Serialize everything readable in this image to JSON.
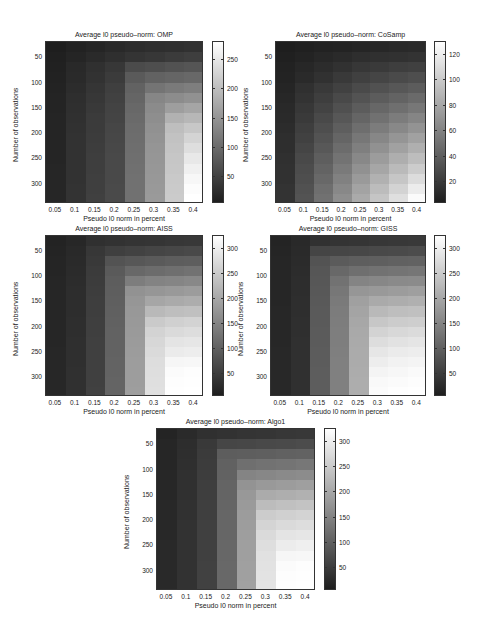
{
  "chart_data": [
    {
      "type": "heatmap",
      "title": "Average l0 pseudo–norm: OMP",
      "xlabel": "Pseudo l0 norm in percent",
      "ylabel": "Number of observations",
      "x": [
        "0.05",
        "0.1",
        "0.15",
        "0.2",
        "0.25",
        "0.3",
        "0.35",
        "0.4"
      ],
      "y": [
        30,
        50,
        70,
        90,
        110,
        130,
        150,
        170,
        190,
        210,
        230,
        250,
        270,
        290,
        310,
        330
      ],
      "yticks": [
        50,
        100,
        150,
        200,
        250,
        300
      ],
      "colorbar": {
        "min": 5,
        "max": 280,
        "ticks": [
          50,
          100,
          150,
          200,
          250
        ]
      },
      "values": [
        [
          5,
          10,
          14,
          18,
          22,
          24,
          26,
          28
        ],
        [
          7,
          14,
          20,
          26,
          32,
          36,
          40,
          44
        ],
        [
          9,
          18,
          27,
          36,
          60,
          64,
          68,
          72
        ],
        [
          10,
          20,
          30,
          40,
          78,
          88,
          92,
          96
        ],
        [
          11,
          22,
          33,
          45,
          88,
          110,
          118,
          122
        ],
        [
          12,
          24,
          36,
          48,
          92,
          132,
          140,
          146
        ],
        [
          12,
          26,
          38,
          50,
          96,
          138,
          162,
          170
        ],
        [
          13,
          27,
          40,
          52,
          98,
          142,
          185,
          192
        ],
        [
          13,
          28,
          41,
          54,
          100,
          145,
          200,
          212
        ],
        [
          14,
          29,
          42,
          55,
          102,
          148,
          205,
          228
        ],
        [
          14,
          29,
          43,
          56,
          103,
          150,
          208,
          240
        ],
        [
          14,
          30,
          44,
          57,
          104,
          152,
          210,
          252
        ],
        [
          15,
          30,
          44,
          58,
          105,
          153,
          212,
          262
        ],
        [
          15,
          30,
          45,
          58,
          106,
          154,
          214,
          270
        ],
        [
          15,
          31,
          45,
          59,
          106,
          155,
          215,
          276
        ],
        [
          15,
          31,
          46,
          59,
          107,
          156,
          216,
          280
        ]
      ]
    },
    {
      "type": "heatmap",
      "title": "Average l0 pseudo–norm: CoSamp",
      "xlabel": "Pseudo l0 norm in percent",
      "ylabel": "Number of observations",
      "x": [
        "0.05",
        "0.1",
        "0.15",
        "0.2",
        "0.25",
        "0.3",
        "0.35",
        "0.4"
      ],
      "y": [
        30,
        50,
        70,
        90,
        110,
        130,
        150,
        170,
        190,
        210,
        230,
        250,
        270,
        290,
        310,
        330
      ],
      "yticks": [
        50,
        100,
        150,
        200,
        250,
        300
      ],
      "colorbar": {
        "min": 3,
        "max": 130,
        "ticks": [
          20,
          40,
          60,
          80,
          100,
          120
        ]
      },
      "values": [
        [
          3,
          4,
          5,
          6,
          7,
          8,
          9,
          10
        ],
        [
          4,
          6,
          8,
          10,
          12,
          13,
          14,
          15
        ],
        [
          5,
          8,
          11,
          14,
          17,
          19,
          21,
          22
        ],
        [
          6,
          10,
          14,
          18,
          22,
          25,
          28,
          30
        ],
        [
          7,
          13,
          18,
          23,
          28,
          32,
          35,
          38
        ],
        [
          8,
          15,
          21,
          27,
          33,
          38,
          42,
          46
        ],
        [
          9,
          17,
          24,
          31,
          38,
          44,
          49,
          53
        ],
        [
          10,
          19,
          27,
          35,
          43,
          50,
          56,
          61
        ],
        [
          11,
          21,
          30,
          39,
          48,
          56,
          63,
          69
        ],
        [
          12,
          23,
          33,
          43,
          53,
          62,
          70,
          77
        ],
        [
          12,
          25,
          36,
          47,
          58,
          68,
          77,
          85
        ],
        [
          13,
          27,
          39,
          51,
          63,
          74,
          84,
          93
        ],
        [
          14,
          29,
          42,
          55,
          68,
          80,
          91,
          101
        ],
        [
          14,
          30,
          45,
          59,
          73,
          86,
          98,
          110
        ],
        [
          15,
          32,
          48,
          63,
          78,
          92,
          105,
          119
        ],
        [
          15,
          33,
          50,
          66,
          82,
          97,
          112,
          128
        ]
      ]
    },
    {
      "type": "heatmap",
      "title": "Average l0 pseudo–norm: AISS",
      "xlabel": "Pseudo l0 norm in percent",
      "ylabel": "Number of observations",
      "x": [
        "0.05",
        "0.1",
        "0.15",
        "0.2",
        "0.25",
        "0.3",
        "0.35",
        "0.4"
      ],
      "y": [
        30,
        50,
        70,
        90,
        110,
        130,
        150,
        170,
        190,
        210,
        230,
        250,
        270,
        290,
        310,
        330
      ],
      "yticks": [
        50,
        100,
        150,
        200,
        250,
        300
      ],
      "colorbar": {
        "min": 5,
        "max": 325,
        "ticks": [
          50,
          100,
          150,
          200,
          250,
          300
        ]
      },
      "values": [
        [
          12,
          18,
          30,
          34,
          36,
          38,
          40,
          42
        ],
        [
          14,
          20,
          40,
          52,
          56,
          60,
          64,
          66
        ],
        [
          15,
          22,
          44,
          80,
          86,
          90,
          94,
          96
        ],
        [
          15,
          24,
          46,
          90,
          110,
          116,
          120,
          124
        ],
        [
          16,
          25,
          48,
          94,
          140,
          148,
          152,
          156
        ],
        [
          16,
          26,
          49,
          96,
          170,
          176,
          180,
          184
        ],
        [
          16,
          27,
          50,
          98,
          175,
          198,
          204,
          208
        ],
        [
          17,
          27,
          51,
          99,
          178,
          225,
          232,
          236
        ],
        [
          17,
          28,
          52,
          100,
          180,
          250,
          258,
          262
        ],
        [
          17,
          28,
          52,
          101,
          182,
          262,
          272,
          276
        ],
        [
          17,
          29,
          53,
          102,
          183,
          268,
          286,
          290
        ],
        [
          18,
          29,
          53,
          102,
          184,
          272,
          296,
          300
        ],
        [
          18,
          29,
          54,
          103,
          185,
          276,
          312,
          314
        ],
        [
          18,
          30,
          54,
          103,
          186,
          278,
          320,
          322
        ],
        [
          18,
          30,
          54,
          104,
          186,
          280,
          322,
          324
        ],
        [
          18,
          30,
          55,
          104,
          187,
          281,
          323,
          325
        ]
      ]
    },
    {
      "type": "heatmap",
      "title": "Average l0 pseudo–norm: GISS",
      "xlabel": "Pseudo l0 norm in percent",
      "ylabel": "Number of observations",
      "x": [
        "0.05",
        "0.1",
        "0.15",
        "0.2",
        "0.25",
        "0.3",
        "0.35",
        "0.4"
      ],
      "y": [
        30,
        50,
        70,
        90,
        110,
        130,
        150,
        170,
        190,
        210,
        230,
        250,
        270,
        290,
        310,
        330
      ],
      "yticks": [
        50,
        100,
        150,
        200,
        250,
        300
      ],
      "colorbar": {
        "min": 5,
        "max": 325,
        "ticks": [
          50,
          100,
          150,
          200,
          250,
          300
        ]
      },
      "values": [
        [
          14,
          20,
          32,
          36,
          38,
          40,
          42,
          44
        ],
        [
          15,
          22,
          60,
          62,
          64,
          66,
          68,
          70
        ],
        [
          16,
          24,
          80,
          92,
          96,
          98,
          100,
          102
        ],
        [
          16,
          25,
          84,
          110,
          120,
          124,
          128,
          130
        ],
        [
          17,
          26,
          86,
          125,
          150,
          154,
          158,
          160
        ],
        [
          17,
          27,
          88,
          132,
          175,
          180,
          184,
          188
        ],
        [
          17,
          28,
          89,
          136,
          190,
          204,
          208,
          212
        ],
        [
          18,
          28,
          90,
          138,
          196,
          226,
          232,
          236
        ],
        [
          18,
          29,
          91,
          140,
          200,
          246,
          252,
          256
        ],
        [
          18,
          29,
          92,
          141,
          202,
          262,
          270,
          274
        ],
        [
          18,
          30,
          92,
          142,
          204,
          276,
          284,
          288
        ],
        [
          19,
          30,
          93,
          143,
          205,
          290,
          296,
          300
        ],
        [
          19,
          30,
          93,
          144,
          206,
          300,
          306,
          310
        ],
        [
          19,
          31,
          94,
          144,
          207,
          310,
          314,
          318
        ],
        [
          19,
          31,
          94,
          145,
          208,
          316,
          320,
          322
        ],
        [
          19,
          31,
          95,
          145,
          208,
          320,
          323,
          325
        ]
      ]
    },
    {
      "type": "heatmap",
      "title": "Average l0 pseudo–norm: Algo1",
      "xlabel": "Pseudo l0 norm in percent",
      "ylabel": "Number of observations",
      "x": [
        "0.05",
        "0.1",
        "0.15",
        "0.2",
        "0.25",
        "0.3",
        "0.35",
        "0.4"
      ],
      "y": [
        30,
        50,
        70,
        90,
        110,
        130,
        150,
        170,
        190,
        210,
        230,
        250,
        270,
        290,
        310,
        330
      ],
      "yticks": [
        50,
        100,
        150,
        200,
        250,
        300
      ],
      "colorbar": {
        "min": 5,
        "max": 325,
        "ticks": [
          50,
          100,
          150,
          200,
          250,
          300
        ]
      },
      "values": [
        [
          14,
          22,
          30,
          34,
          36,
          38,
          40,
          42
        ],
        [
          16,
          26,
          44,
          62,
          64,
          66,
          68,
          70
        ],
        [
          17,
          28,
          46,
          94,
          96,
          98,
          100,
          102
        ],
        [
          17,
          29,
          48,
          100,
          120,
          124,
          128,
          132
        ],
        [
          18,
          30,
          49,
          102,
          150,
          154,
          158,
          162
        ],
        [
          18,
          31,
          50,
          104,
          172,
          180,
          184,
          188
        ],
        [
          18,
          31,
          51,
          105,
          178,
          205,
          210,
          214
        ],
        [
          19,
          32,
          52,
          106,
          182,
          230,
          236,
          240
        ],
        [
          19,
          32,
          52,
          107,
          184,
          252,
          258,
          262
        ],
        [
          19,
          33,
          53,
          108,
          186,
          264,
          272,
          276
        ],
        [
          19,
          33,
          53,
          108,
          187,
          272,
          286,
          290
        ],
        [
          20,
          33,
          54,
          109,
          188,
          278,
          298,
          302
        ],
        [
          20,
          34,
          54,
          109,
          189,
          282,
          312,
          314
        ],
        [
          20,
          34,
          55,
          110,
          190,
          284,
          320,
          322
        ],
        [
          20,
          34,
          55,
          110,
          190,
          285,
          322,
          324
        ],
        [
          20,
          34,
          55,
          110,
          191,
          286,
          323,
          325
        ]
      ]
    }
  ]
}
